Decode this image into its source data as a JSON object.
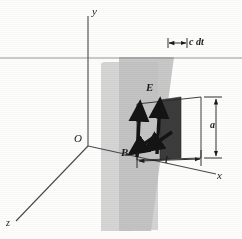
{
  "figure": {
    "kind": "physics-diagram",
    "background_color": "#fdfdfc",
    "ink_color": "#1c1c1c"
  },
  "axes": {
    "y_label": "y",
    "x_label": "x",
    "z_label": "z",
    "origin_label": "O"
  },
  "vectors": {
    "e_label": "E",
    "b_label": "B"
  },
  "dimensions": {
    "width_label": "l",
    "height_label": "a",
    "advance_label": "c dt"
  },
  "planes": {
    "front_plane_color": "#cfcfcf",
    "back_plane_color": "#b8b8b8",
    "swept_band_color": "#3a3a3a"
  }
}
